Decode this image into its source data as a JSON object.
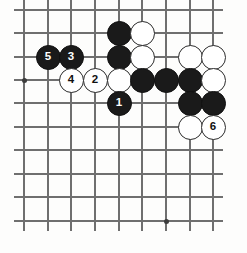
{
  "diagram": {
    "board": {
      "columns": 9,
      "rows": 10,
      "col_x": [
        24,
        48,
        71,
        95,
        119,
        142,
        166,
        190,
        213
      ],
      "row_y": [
        10,
        33,
        57,
        80,
        103,
        127,
        150,
        174,
        197,
        221
      ],
      "line_color": "#6f6f6f",
      "background_color": "#fdfdfc",
      "black_color": "#1a1a1a",
      "white_color": "#ffffff"
    },
    "star_points": [
      {
        "col": 0,
        "row": 3
      },
      {
        "col": 6,
        "row": 9
      }
    ],
    "stones": [
      {
        "col": 4,
        "row": 1,
        "color": "black",
        "label": ""
      },
      {
        "col": 5,
        "row": 1,
        "color": "white",
        "label": ""
      },
      {
        "col": 1,
        "row": 2,
        "color": "black",
        "label": "5"
      },
      {
        "col": 2,
        "row": 2,
        "color": "black",
        "label": "3"
      },
      {
        "col": 4,
        "row": 2,
        "color": "black",
        "label": ""
      },
      {
        "col": 5,
        "row": 2,
        "color": "white",
        "label": ""
      },
      {
        "col": 7,
        "row": 2,
        "color": "white",
        "label": ""
      },
      {
        "col": 8,
        "row": 2,
        "color": "white",
        "label": ""
      },
      {
        "col": 2,
        "row": 3,
        "color": "white",
        "label": "4"
      },
      {
        "col": 3,
        "row": 3,
        "color": "white",
        "label": "2"
      },
      {
        "col": 4,
        "row": 3,
        "color": "white",
        "label": ""
      },
      {
        "col": 5,
        "row": 3,
        "color": "black",
        "label": ""
      },
      {
        "col": 6,
        "row": 3,
        "color": "black",
        "label": ""
      },
      {
        "col": 7,
        "row": 3,
        "color": "black",
        "label": ""
      },
      {
        "col": 8,
        "row": 3,
        "color": "white",
        "label": ""
      },
      {
        "col": 4,
        "row": 4,
        "color": "black",
        "label": "1"
      },
      {
        "col": 7,
        "row": 4,
        "color": "black",
        "label": ""
      },
      {
        "col": 8,
        "row": 4,
        "color": "black",
        "label": ""
      },
      {
        "col": 7,
        "row": 5,
        "color": "white",
        "label": ""
      },
      {
        "col": 8,
        "row": 5,
        "color": "white",
        "label": "6"
      }
    ],
    "move_sequence": [
      {
        "number": "1",
        "color": "black"
      },
      {
        "number": "2",
        "color": "white"
      },
      {
        "number": "3",
        "color": "black"
      },
      {
        "number": "4",
        "color": "white"
      },
      {
        "number": "5",
        "color": "black"
      },
      {
        "number": "6",
        "color": "white"
      }
    ]
  }
}
